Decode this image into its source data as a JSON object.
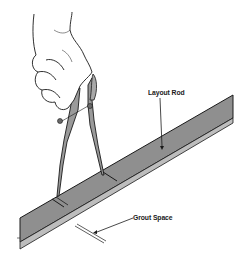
{
  "figure": {
    "labels": {
      "layout_rod": "Layout Rod",
      "grout_space": "Grout Space"
    },
    "colors": {
      "rod_fill": "#8f8f8f",
      "line": "#1a1a1a",
      "background": "#ffffff",
      "divider_fill": "#9a9a9a"
    }
  }
}
